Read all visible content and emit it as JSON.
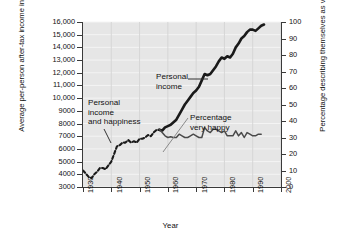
{
  "chart_data": {
    "type": "line",
    "title": "",
    "xlabel": "Year",
    "ylabel": "Average per-person after-tax income in 1990 ($)",
    "ylabel_right": "Percentage describing themselves as very happy",
    "xlim": [
      1930,
      2000
    ],
    "ylim": [
      3000,
      16000
    ],
    "ylim_right": [
      0,
      100
    ],
    "grid": true,
    "legend_position": "inline-annotations",
    "x_ticks": [
      "1930",
      "1940",
      "1950",
      "1960",
      "1970",
      "1980",
      "1990",
      "2000"
    ],
    "y_ticks_left": [
      "16,000",
      "15,000",
      "14,000",
      "13,000",
      "12,000",
      "11,000",
      "10,000",
      "9000",
      "8000",
      "7000",
      "6000",
      "5000",
      "4000",
      "3000"
    ],
    "y_ticks_right": [
      "100",
      "90",
      "80",
      "70",
      "60",
      "50",
      "40",
      "30",
      "20",
      "10",
      "0"
    ],
    "series": [
      {
        "name": "Personal income",
        "axis": "left",
        "style": "solid-thick-black-from-1957-dashed-before",
        "color": "#1a1a1a",
        "x": [
          1930,
          1932,
          1933,
          1934,
          1935,
          1936,
          1937,
          1938,
          1939,
          1940,
          1941,
          1942,
          1943,
          1944,
          1945,
          1946,
          1947,
          1948,
          1949,
          1950,
          1951,
          1952,
          1953,
          1954,
          1955,
          1956,
          1957,
          1958,
          1959,
          1960,
          1961,
          1962,
          1963,
          1964,
          1965,
          1966,
          1967,
          1968,
          1969,
          1970,
          1971,
          1972,
          1973,
          1974,
          1975,
          1976,
          1977,
          1978,
          1979,
          1980,
          1981,
          1982,
          1983,
          1984,
          1985,
          1986,
          1987,
          1988,
          1989,
          1990,
          1991,
          1992,
          1993,
          1994
        ],
        "y": [
          4300,
          3800,
          3700,
          4000,
          4200,
          4500,
          4500,
          4400,
          4700,
          5000,
          5600,
          6200,
          6300,
          6500,
          6500,
          6700,
          6500,
          6600,
          6500,
          6800,
          6800,
          6900,
          7100,
          7000,
          7300,
          7500,
          7500,
          7450,
          7700,
          7800,
          7900,
          8100,
          8300,
          8700,
          9100,
          9500,
          9800,
          10100,
          10400,
          10600,
          10900,
          11400,
          11900,
          11800,
          11900,
          12200,
          12500,
          12900,
          13200,
          13100,
          13300,
          13200,
          13500,
          14000,
          14300,
          14700,
          14900,
          15200,
          15400,
          15400,
          15300,
          15500,
          15700,
          15800
        ]
      },
      {
        "name": "Percentage very happy",
        "axis": "right",
        "style": "solid-thin-dark",
        "color": "#4a4a4a",
        "x": [
          1957,
          1958,
          1959,
          1960,
          1961,
          1962,
          1963,
          1964,
          1965,
          1966,
          1967,
          1968,
          1969,
          1970,
          1971,
          1972,
          1973,
          1974,
          1975,
          1976,
          1977,
          1978,
          1979,
          1980,
          1981,
          1982,
          1983,
          1984,
          1985,
          1986,
          1987,
          1988,
          1989,
          1990,
          1991,
          1992,
          1993
        ],
        "y": [
          35,
          33,
          31,
          30,
          30.5,
          30,
          30,
          32,
          31,
          30,
          30,
          31,
          32,
          31,
          30,
          30,
          36,
          34,
          33,
          35,
          35,
          34,
          33,
          34,
          31,
          31,
          31,
          34,
          31,
          33,
          30,
          33,
          32,
          31,
          31,
          32,
          32
        ]
      }
    ],
    "annotations": [
      {
        "id": "income-happiness",
        "text": "Personal\nincome\nand happiness"
      },
      {
        "id": "personal-income",
        "text": "Personal\nincome"
      },
      {
        "id": "pct-happy",
        "text": "Percentage\nvery happy"
      }
    ]
  },
  "colors": {
    "plot_background": "#e6e6e6",
    "gridline": "#f4f4f4",
    "axis": "#3a3a3a",
    "income_line": "#1a1a1a",
    "happy_line": "#4a4a4a",
    "text": "#111111"
  }
}
